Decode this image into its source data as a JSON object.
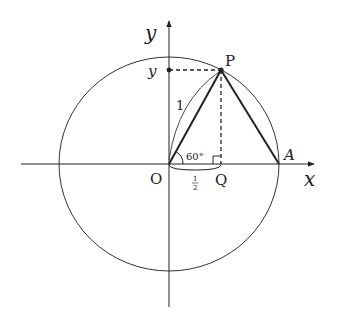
{
  "diagram": {
    "title": "",
    "axes": {
      "x_label": "x",
      "y_label": "y"
    },
    "points": {
      "origin": "O",
      "p": "P",
      "q": "Q",
      "a": "A",
      "y_marker": "y"
    },
    "annotations": {
      "radius_label": "1",
      "angle_label": "60°",
      "base_num": "1",
      "base_den": "2"
    },
    "colors": {
      "stroke": "#222222",
      "background": "#ffffff"
    }
  }
}
